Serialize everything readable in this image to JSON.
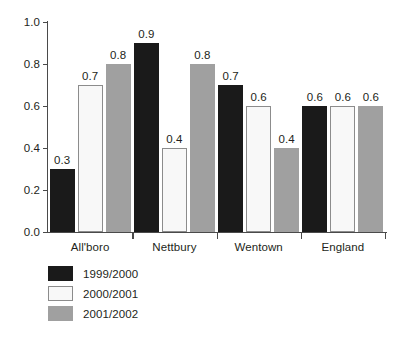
{
  "chart_data": {
    "type": "bar",
    "title": "",
    "subtitle": "",
    "xlabel": "",
    "ylabel": "",
    "categories": [
      "All'boro",
      "Nettbury",
      "Wentown",
      "England"
    ],
    "series": [
      {
        "name": "1999/2000",
        "color": "#1a1a1a",
        "values": [
          0.3,
          0.9,
          0.7,
          0.6
        ]
      },
      {
        "name": "2000/2001",
        "color": "#f8f8f8",
        "values": [
          0.7,
          0.4,
          0.6,
          0.6
        ]
      },
      {
        "name": "2001/2002",
        "color": "#a0a0a0",
        "values": [
          0.8,
          0.8,
          0.4,
          0.6
        ]
      }
    ],
    "data_labels": [
      [
        "0.3",
        "0.9",
        "0.7",
        "0.6"
      ],
      [
        "0.7",
        "0.4",
        "0.6",
        "0.6"
      ],
      [
        "0.8",
        "0.8",
        "0.4",
        "0.6"
      ]
    ],
    "ylim": [
      0.0,
      1.0
    ],
    "ytick_values": [
      0.0,
      0.2,
      0.4,
      0.6,
      0.8,
      1.0
    ],
    "ytick_labels": [
      "0.0",
      "0.2",
      "0.4",
      "0.6",
      "0.8",
      "1.0"
    ],
    "grid": false,
    "legend_position": "bottom-left",
    "background_color": "#ffffff",
    "axis_color": "#4a4a4a",
    "text_color": "#231f20"
  }
}
